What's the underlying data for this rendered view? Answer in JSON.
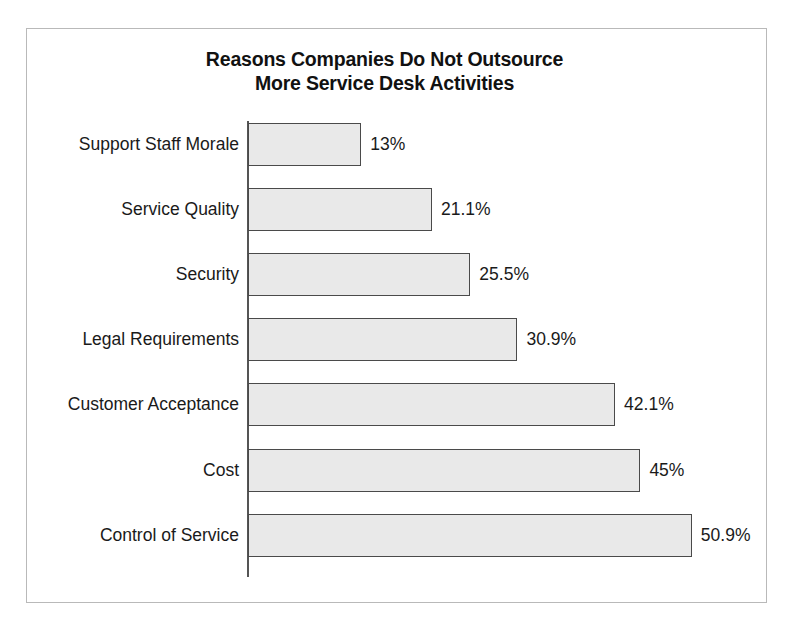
{
  "chart_data": {
    "type": "bar",
    "orientation": "horizontal",
    "title": "Reasons Companies Do Not Outsource\nMore Service Desk Activities",
    "xlabel": "",
    "ylabel": "",
    "grid": false,
    "legend": null,
    "xlim": [
      0,
      50.9
    ],
    "value_suffix": "%",
    "categories": [
      "Support Staff Morale",
      "Service Quality",
      "Security",
      "Legal Requirements",
      "Customer Acceptance",
      "Cost",
      "Control of Service"
    ],
    "values": [
      13,
      21.1,
      25.5,
      30.9,
      42.1,
      45,
      50.9
    ],
    "value_labels": [
      "13%",
      "21.1%",
      "25.5%",
      "30.9%",
      "42.1%",
      "45%",
      "50.9%"
    ],
    "colors": {
      "bar_fill": "#e9e9e9",
      "bar_border": "#4a4a4a",
      "axis": "#555555",
      "text": "#1a1a1a",
      "frame": "#b9b9b9",
      "background": "#ffffff"
    }
  }
}
